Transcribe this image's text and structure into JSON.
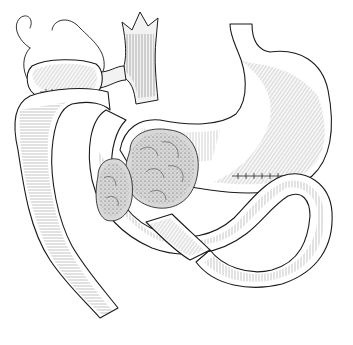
{
  "illustration": {
    "kind": "anatomical pen-and-ink drawing",
    "subject": "stomach with looped small intestine, surgical anastomoses, and lobulated masses",
    "style": "black line art with stippled and hatched shading on white",
    "colors": {
      "background": "#ffffff",
      "ink": "#1a1a1a",
      "mass_shade": "#d8d8d8"
    },
    "elements": [
      "stomach",
      "esophagus-stump",
      "aorta-vessel-trunk",
      "gallbladder-pouch-with-suture-line",
      "free-suture-thread",
      "intestinal-loop-left-descending",
      "intestinal-loop-crossing",
      "lobulated-mass-large",
      "lobulated-mass-small",
      "gastrojejunal-suture-line"
    ]
  }
}
